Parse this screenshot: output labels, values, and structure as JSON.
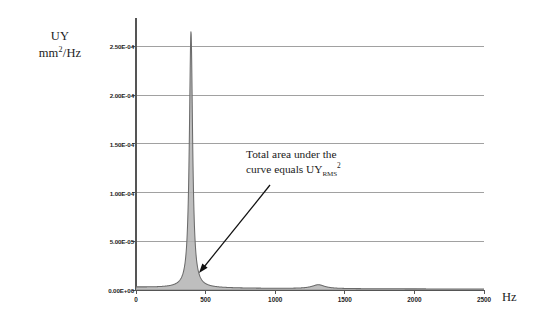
{
  "chart_data": {
    "type": "line",
    "title": "",
    "xlabel": "Hz",
    "ylabel": "UY mm^2/Hz",
    "ylabel_line1": "UY",
    "ylabel_line2_base": "mm",
    "ylabel_line2_sup": "2",
    "ylabel_line2_tail": "/Hz",
    "xunit": "Hz",
    "xlim": [
      0,
      2500
    ],
    "ylim": [
      0,
      0.000275
    ],
    "grid": "horizontal",
    "legend": "none",
    "series_name": "UY PSD",
    "fill": true,
    "fill_color": "#b3b3b3",
    "line_color": "#6b6b6b",
    "axis_color": "#555555",
    "grid_color": "#8a8a8a",
    "xticks": [
      0,
      500,
      1000,
      1500,
      2000,
      2500
    ],
    "xtick_labels": [
      "0",
      "500",
      "1000",
      "1500",
      "2000",
      "2500"
    ],
    "yticks": [
      0,
      5e-05,
      0.0001,
      0.00015,
      0.0002,
      0.00025
    ],
    "ytick_labels": [
      "0.00E+00",
      "5.00E-05",
      "1.00E-04",
      "1.50E-04",
      "2.00E-04",
      "2.50E-04"
    ],
    "peaks": [
      {
        "center": 395,
        "height": 0.000263,
        "width": 14,
        "label": "primary resonance"
      },
      {
        "center": 1310,
        "height": 4e-06,
        "width": 55,
        "label": "secondary bump"
      }
    ],
    "baseline": 1e-06,
    "x": [
      0,
      50,
      100,
      150,
      200,
      250,
      300,
      330,
      355,
      370,
      380,
      388,
      392,
      395,
      398,
      402,
      410,
      420,
      435,
      455,
      480,
      520,
      570,
      640,
      720,
      820,
      950,
      1100,
      1220,
      1280,
      1310,
      1350,
      1420,
      1550,
      1700,
      1900,
      2100,
      2300,
      2500
    ],
    "values": [
      1e-06,
      1.2e-06,
      1.6e-06,
      2.4e-06,
      3.6e-06,
      5.6e-06,
      9e-06,
      1.35e-05,
      2.4e-05,
      5e-05,
      9.5e-05,
      0.00019,
      0.000245,
      0.000263,
      0.00024,
      0.000175,
      8e-05,
      4.2e-05,
      2.2e-05,
      1.2e-05,
      7.5e-06,
      4.6e-06,
      3e-06,
      2.1e-06,
      1.7e-06,
      1.4e-06,
      1.2e-06,
      1.15e-06,
      1.4e-06,
      2.4e-06,
      4e-06,
      2.6e-06,
      1.4e-06,
      1.1e-06,
      1e-06,
      9e-07,
      8.5e-07,
      8e-07,
      7.5e-07
    ],
    "annotations": [
      {
        "line1": "Total area under the",
        "line2_pre": "curve equals UY",
        "line2_sub": "RMS",
        "line2_sup": "2",
        "arrow_from": [
          270,
          185
        ],
        "arrow_to": [
          199,
          273
        ]
      }
    ]
  },
  "annotation_text": {
    "line1": "Total area under the",
    "line2_pre": "curve equals UY",
    "line2_sub": "RMS",
    "line2_sup": "2"
  },
  "axis": {
    "y_title_line1": "UY",
    "y_title_line2_base": "mm",
    "y_title_line2_sup": "2",
    "y_title_line2_tail": "/Hz",
    "x_unit": "Hz"
  }
}
